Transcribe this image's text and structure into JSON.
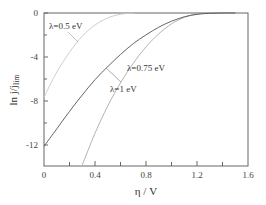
{
  "chart_data": {
    "type": "line",
    "title": "",
    "xlabel": "η / V",
    "ylabel": "ln j/j_lim",
    "ylabel_main": "ln j",
    "ylabel_sub": "/j",
    "ylabel_subscript": "lim",
    "xlim": [
      0,
      1.6
    ],
    "ylim": [
      -14,
      0
    ],
    "x_ticks": [
      "0",
      "0.4",
      "0.8",
      "1.2",
      "1.6"
    ],
    "y_ticks": [
      "0",
      "-4",
      "-8",
      "-12"
    ],
    "grid": false,
    "legend": "none (inline annotations)",
    "series": [
      {
        "name": "λ=0.5 eV",
        "color": "#c8c8c8",
        "x": [
          0,
          0.1,
          0.2,
          0.3,
          0.4,
          0.5,
          0.6,
          0.7
        ],
        "y": [
          -7.7,
          -5.4,
          -3.6,
          -2.1,
          -1.1,
          -0.45,
          -0.12,
          0
        ]
      },
      {
        "name": "λ=0.75 eV",
        "color": "#aaaaaa",
        "x": [
          0.3,
          0.4,
          0.5,
          0.6,
          0.7,
          0.8,
          0.9,
          1.0,
          1.1,
          1.2,
          1.3
        ],
        "y": [
          -13.9,
          -11.0,
          -8.5,
          -6.4,
          -4.6,
          -3.1,
          -1.9,
          -1.0,
          -0.4,
          -0.1,
          0
        ]
      },
      {
        "name": "λ=1 eV",
        "color": "#555555",
        "x": [
          0,
          0.1,
          0.2,
          0.3,
          0.4,
          0.5,
          0.6,
          0.7,
          0.8,
          0.9,
          1.0,
          1.1,
          1.2,
          1.3,
          1.4,
          1.5
        ],
        "y": [
          -12.2,
          -10.6,
          -9.0,
          -7.5,
          -6.1,
          -4.9,
          -3.8,
          -2.8,
          -2.0,
          -1.3,
          -0.75,
          -0.35,
          -0.12,
          -0.03,
          0,
          0
        ]
      }
    ],
    "annotations": [
      {
        "text": "λ=0.5 eV",
        "x": 0.04,
        "y": -1.7
      },
      {
        "text": "λ=0.75 eV",
        "x": 0.76,
        "y": -6.4
      },
      {
        "text": "λ=1 eV",
        "x": 0.56,
        "y": -9.0
      }
    ]
  }
}
